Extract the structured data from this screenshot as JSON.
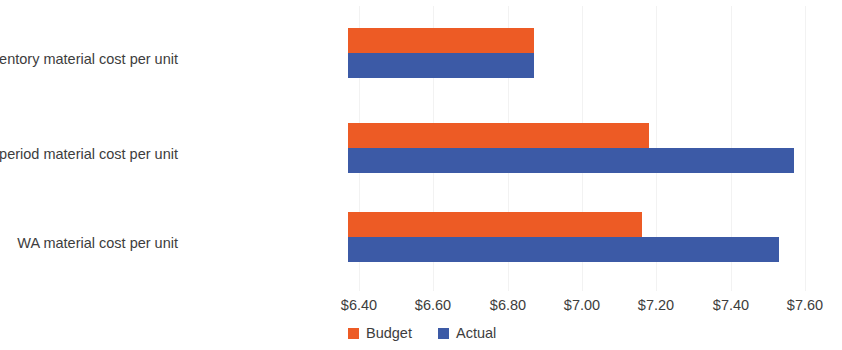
{
  "chart_data": {
    "type": "bar",
    "orientation": "horizontal",
    "title": "",
    "xlabel": "",
    "ylabel": "",
    "categories": [
      "FIFO beg. inventory material cost per unit",
      "FIFO current period material cost per unit",
      "WA material cost per unit"
    ],
    "series": [
      {
        "name": "Budget",
        "color": "#ED5B25",
        "values": [
          6.87,
          7.18,
          7.16
        ]
      },
      {
        "name": "Actual",
        "color": "#3C5AA6",
        "values": [
          6.87,
          7.57,
          7.53
        ]
      }
    ],
    "xlim": [
      6.37,
      7.6
    ],
    "xticks": [
      6.4,
      6.6,
      6.8,
      7.0,
      7.2,
      7.4,
      7.6
    ],
    "xticklabels": [
      "$6.40",
      "$6.60",
      "$6.80",
      "$7.00",
      "$7.20",
      "$7.40",
      "$7.60"
    ],
    "grid": true,
    "gridline_color": "#f2f2f2",
    "legend_position": "bottom-left",
    "background": "#ffffff"
  },
  "legend": {
    "items": [
      {
        "label": "Budget",
        "color": "#ED5B25",
        "icon": "square-swatch-icon"
      },
      {
        "label": "Actual",
        "color": "#3C5AA6",
        "icon": "square-swatch-icon"
      }
    ]
  }
}
